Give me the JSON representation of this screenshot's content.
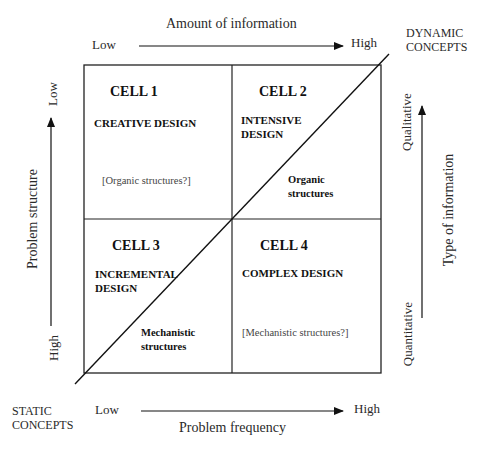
{
  "top_axis": {
    "title": "Amount of information",
    "low": "Low",
    "high": "High"
  },
  "bottom_axis": {
    "title": "Problem frequency",
    "low": "Low",
    "high": "High"
  },
  "left_axis": {
    "title": "Problem structure",
    "top_label": "Low",
    "bottom_label": "High"
  },
  "right_axis": {
    "title": "Type of information",
    "top_label": "Qualitative",
    "bottom_label": "Quantitative"
  },
  "corners": {
    "top_right": [
      "DYNAMIC",
      "CONCEPTS"
    ],
    "bottom_left": [
      "STATIC",
      "CONCEPTS"
    ]
  },
  "cells": [
    {
      "id": "CELL 1",
      "name_lines": [
        "CREATIVE DESIGN"
      ],
      "note": "[Organic structures?]"
    },
    {
      "id": "CELL 2",
      "name_lines": [
        "INTENSIVE",
        "DESIGN"
      ],
      "note": ""
    },
    {
      "id": "CELL 3",
      "name_lines": [
        "INCREMENTAL",
        "DESIGN"
      ],
      "note": ""
    },
    {
      "id": "CELL 4",
      "name_lines": [
        "COMPLEX DESIGN"
      ],
      "note": "[Mechanistic structures?]"
    }
  ],
  "diagonal_labels": {
    "upper": [
      "Organic",
      "structures"
    ],
    "lower": [
      "Mechanistic",
      "structures"
    ]
  }
}
